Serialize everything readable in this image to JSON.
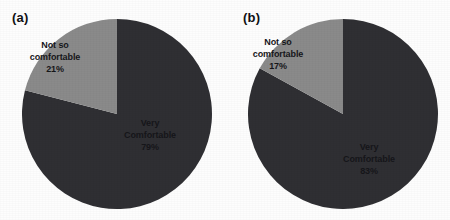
{
  "figure": {
    "background_color": "#fdfdfd",
    "panels": [
      {
        "tag": "(a)",
        "name": "panel-a"
      },
      {
        "tag": "(b)",
        "name": "panel-b"
      }
    ]
  },
  "chart_data": [
    {
      "type": "pie",
      "title": "(a)",
      "labels": [
        "Very Comfortable",
        "Not so comfortable"
      ],
      "values": [
        79,
        21
      ],
      "value_labels": [
        "79%",
        "83%"
      ],
      "colors": [
        "#2f2f33",
        "#8a8a8a"
      ],
      "start_angle_deg": 0,
      "direction": "clockwise",
      "legend": "none",
      "grid": false,
      "slices": [
        {
          "name": "Very Comfortable",
          "label_line1": "Very",
          "label_line2": "Comfortable",
          "percent_label": "79%",
          "value": 79,
          "color": "#2f2f33"
        },
        {
          "name": "Not so comfortable",
          "label_line1": "Not so",
          "label_line2": "comfortable",
          "percent_label": "21%",
          "value": 21,
          "color": "#8a8a8a"
        }
      ]
    },
    {
      "type": "pie",
      "title": "(b)",
      "labels": [
        "Very Comfortable",
        "Not so comfortable"
      ],
      "values": [
        83,
        17
      ],
      "value_labels": [
        "83%",
        "17%"
      ],
      "colors": [
        "#2f2f33",
        "#8a8a8a"
      ],
      "start_angle_deg": 0,
      "direction": "clockwise",
      "legend": "none",
      "grid": false,
      "slices": [
        {
          "name": "Very Comfortable",
          "label_line1": "Very",
          "label_line2": "Comfortable",
          "percent_label": "83%",
          "value": 83,
          "color": "#2f2f33"
        },
        {
          "name": "Not so comfortable",
          "label_line1": "Not so",
          "label_line2": "comfortable",
          "percent_label": "17%",
          "value": 17,
          "color": "#8a8a8a"
        }
      ]
    }
  ]
}
